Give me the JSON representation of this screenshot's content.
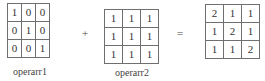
{
  "operands": [
    {
      "name": "operarr1",
      "matrix": [
        [
          "1",
          "0",
          "0"
        ],
        [
          "0",
          "1",
          "0"
        ],
        [
          "0",
          "0",
          "1"
        ]
      ]
    },
    {
      "name": "operarr2",
      "matrix": [
        [
          "1",
          "1",
          "1"
        ],
        [
          "1",
          "1",
          "1"
        ],
        [
          "1",
          "1",
          "1"
        ]
      ]
    }
  ],
  "operators": {
    "plus": "+",
    "equals": "="
  },
  "result": {
    "matrix": [
      [
        "2",
        "1",
        "1"
      ],
      [
        "1",
        "2",
        "1"
      ],
      [
        "1",
        "1",
        "2"
      ]
    ]
  }
}
